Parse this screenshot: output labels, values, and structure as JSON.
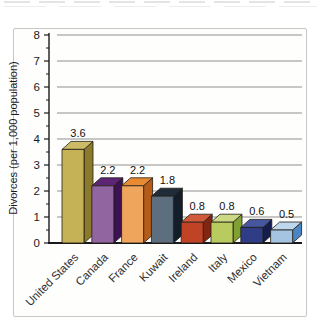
{
  "figure_box": {
    "border_color": "#c6c6c2",
    "background": "#fefefd"
  },
  "chart_data": {
    "type": "bar",
    "style_3d": true,
    "title": "",
    "xlabel": "",
    "ylabel": "Divorces (per 1,000 population)",
    "ylim": [
      0,
      8
    ],
    "ytick_labels": [
      "0",
      "1",
      "2",
      "3",
      "4",
      "5",
      "6",
      "7",
      "8"
    ],
    "minor_tick_step": 0.5,
    "grid": "horizontal",
    "legend": "none",
    "categories": [
      "United States",
      "Canada",
      "France",
      "Kuwait",
      "Ireland",
      "Italy",
      "Mexico",
      "Vietnam"
    ],
    "values": [
      3.6,
      2.2,
      2.2,
      1.8,
      0.8,
      0.8,
      0.6,
      0.5
    ],
    "value_labels": [
      "3.6",
      "2.2",
      "2.2",
      "1.8",
      "0.8",
      "0.8",
      "0.6",
      "0.5"
    ],
    "bar_colors": [
      {
        "front": "#c5b156",
        "side": "#8b7a2c",
        "top": "#cdbb66"
      },
      {
        "front": "#91659f",
        "side": "#3d1253",
        "top": "#5e2575"
      },
      {
        "front": "#f0a55c",
        "side": "#b65c18",
        "top": "#e88a31"
      },
      {
        "front": "#5d6f7e",
        "side": "#141e2a",
        "top": "#202c3a"
      },
      {
        "front": "#c04326",
        "side": "#832511",
        "top": "#cf5b3a"
      },
      {
        "front": "#b7cb5e",
        "side": "#7fa032",
        "top": "#cbd884"
      },
      {
        "front": "#2e3d85",
        "side": "#141d50",
        "top": "#46579f"
      },
      {
        "front": "#a4c4e2",
        "side": "#4a87c2",
        "top": "#bfd7ec"
      }
    ],
    "axis_color": "#1a1a1a",
    "grid_color": "#8f8f8f",
    "tick_label_color": "#1a1a1a",
    "value_label_color": "#111111",
    "category_label_color": "#2d2d2d"
  }
}
